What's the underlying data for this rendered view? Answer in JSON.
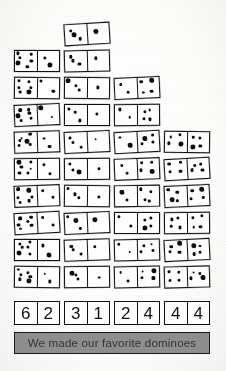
{
  "page": {
    "background_color": "#ffffff",
    "ink_color": "#101010"
  },
  "caption": {
    "text": "We made our favorite dominoes",
    "background_color": "#8e8e8e",
    "border_color": "#1a1a1a"
  },
  "grid": {
    "columns": 4,
    "rows": 10,
    "note": "Hand-drawn dominoes arranged in a staircase; each cell lists pip counts for left and right halves."
  },
  "rows": [
    {
      "cells": [
        null,
        {
          "left": 3,
          "right": 1
        },
        null,
        null
      ]
    },
    {
      "cells": [
        {
          "left": 6,
          "right": 2
        },
        {
          "left": 3,
          "right": 1
        },
        null,
        null
      ]
    },
    {
      "cells": [
        {
          "left": 6,
          "right": 2
        },
        {
          "left": 3,
          "right": 1
        },
        {
          "left": 2,
          "right": 4
        },
        null
      ]
    },
    {
      "cells": [
        {
          "left": 6,
          "right": 2
        },
        {
          "left": 3,
          "right": 1
        },
        {
          "left": 2,
          "right": 4
        },
        null
      ]
    },
    {
      "cells": [
        {
          "left": 6,
          "right": 2
        },
        {
          "left": 3,
          "right": 1
        },
        {
          "left": 2,
          "right": 4
        },
        {
          "left": 4,
          "right": 4
        }
      ]
    },
    {
      "cells": [
        {
          "left": 6,
          "right": 2
        },
        {
          "left": 3,
          "right": 1
        },
        {
          "left": 2,
          "right": 4
        },
        {
          "left": 4,
          "right": 4
        }
      ]
    },
    {
      "cells": [
        {
          "left": 6,
          "right": 2
        },
        {
          "left": 3,
          "right": 1
        },
        {
          "left": 2,
          "right": 4
        },
        {
          "left": 4,
          "right": 4
        }
      ]
    },
    {
      "cells": [
        {
          "left": 6,
          "right": 2
        },
        {
          "left": 3,
          "right": 1
        },
        {
          "left": 2,
          "right": 4
        },
        {
          "left": 4,
          "right": 4
        }
      ]
    },
    {
      "cells": [
        {
          "left": 6,
          "right": 2
        },
        {
          "left": 3,
          "right": 1
        },
        {
          "left": 2,
          "right": 4
        },
        {
          "left": 4,
          "right": 4
        }
      ]
    },
    {
      "cells": [
        {
          "left": 6,
          "right": 2
        },
        {
          "left": 3,
          "right": 1
        },
        {
          "left": 2,
          "right": 4
        },
        {
          "left": 4,
          "right": 4
        }
      ]
    }
  ],
  "number_row": {
    "dominoes": [
      {
        "left": "6",
        "right": "2"
      },
      {
        "left": "3",
        "right": "1"
      },
      {
        "left": "2",
        "right": "4"
      },
      {
        "left": "4",
        "right": "4"
      }
    ]
  }
}
